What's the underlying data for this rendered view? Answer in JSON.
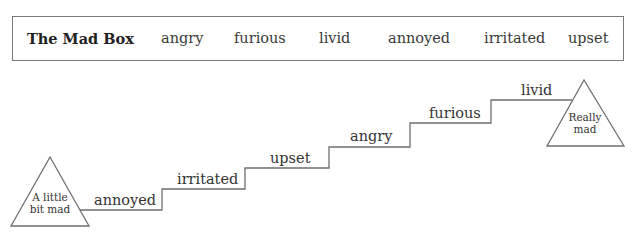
{
  "box": {
    "title": "The Mad Box",
    "words": [
      "angry",
      "furious",
      "livid",
      "annoyed",
      "irritated",
      "upset"
    ]
  },
  "staircase": {
    "start_label": [
      "A little",
      "bit mad"
    ],
    "end_label": [
      "Really",
      "mad"
    ],
    "steps": [
      "annoyed",
      "irritated",
      "upset",
      "angry",
      "furious",
      "livid"
    ]
  },
  "colors": {
    "line": "#6f6f6f",
    "text": "#333333"
  }
}
